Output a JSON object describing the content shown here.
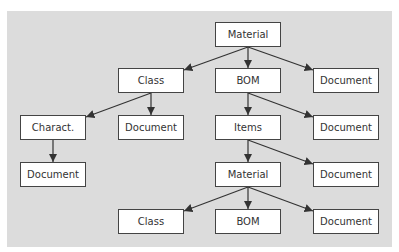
{
  "diagram": {
    "type": "tree",
    "background": "#dcdcdc",
    "nodes": [
      {
        "id": "material_root",
        "label": "Material",
        "x": 215,
        "y": 22,
        "w": 66
      },
      {
        "id": "class_1",
        "label": "Class",
        "x": 118,
        "y": 68,
        "w": 66
      },
      {
        "id": "bom_1",
        "label": "BOM",
        "x": 215,
        "y": 68,
        "w": 66
      },
      {
        "id": "document_1",
        "label": "Document",
        "x": 313,
        "y": 68,
        "w": 66
      },
      {
        "id": "charact",
        "label": "Charact.",
        "x": 20,
        "y": 115,
        "w": 66
      },
      {
        "id": "document_2",
        "label": "Document",
        "x": 118,
        "y": 115,
        "w": 66
      },
      {
        "id": "items",
        "label": "Items",
        "x": 215,
        "y": 115,
        "w": 66
      },
      {
        "id": "document_3",
        "label": "Document",
        "x": 313,
        "y": 115,
        "w": 66
      },
      {
        "id": "document_4",
        "label": "Document",
        "x": 20,
        "y": 162,
        "w": 66
      },
      {
        "id": "material_2",
        "label": "Material",
        "x": 215,
        "y": 162,
        "w": 66
      },
      {
        "id": "document_5",
        "label": "Document",
        "x": 313,
        "y": 162,
        "w": 66
      },
      {
        "id": "class_2",
        "label": "Class",
        "x": 118,
        "y": 209,
        "w": 66
      },
      {
        "id": "bom_2",
        "label": "BOM",
        "x": 215,
        "y": 209,
        "w": 66
      },
      {
        "id": "document_6",
        "label": "Document",
        "x": 313,
        "y": 209,
        "w": 66
      }
    ],
    "edges": [
      [
        "material_root",
        "class_1"
      ],
      [
        "material_root",
        "bom_1"
      ],
      [
        "material_root",
        "document_1"
      ],
      [
        "class_1",
        "charact"
      ],
      [
        "class_1",
        "document_2"
      ],
      [
        "bom_1",
        "items"
      ],
      [
        "bom_1",
        "document_3"
      ],
      [
        "charact",
        "document_4"
      ],
      [
        "items",
        "material_2"
      ],
      [
        "items",
        "document_5"
      ],
      [
        "material_2",
        "class_2"
      ],
      [
        "material_2",
        "bom_2"
      ],
      [
        "material_2",
        "document_6"
      ]
    ]
  }
}
